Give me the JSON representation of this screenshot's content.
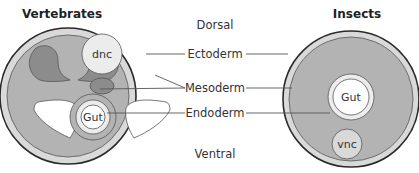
{
  "titles": {
    "left": "Vertebrates",
    "right": "Insects"
  },
  "axis": {
    "top": "Dorsal",
    "bottom": "Ventral"
  },
  "layers": {
    "ectoderm": "Ectoderm",
    "mesoderm": "Mesoderm",
    "endoderm": "Endoderm"
  },
  "structures": {
    "vertebrate_dnc": "dnc",
    "vertebrate_gut": "Gut",
    "insect_gut": "Gut",
    "insect_vnc": "vnc"
  },
  "colors": {
    "outline": "#2a2a2a",
    "ectoderm": "#d9d9d9",
    "mesoderm": "#b3b3b3",
    "dark_mesoderm": "#8c8c8c",
    "lumen": "#ffffff",
    "line": "#555555"
  }
}
